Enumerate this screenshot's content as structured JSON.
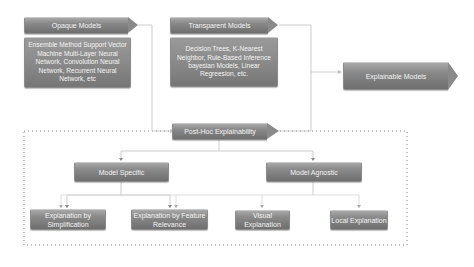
{
  "diagram": {
    "colors": {
      "box_fill_top": "#a8a8a8",
      "box_fill_bottom": "#6e6e6e",
      "text": "#f4f4f4",
      "connector": "#c0c0c0",
      "dotted_border": "#6a6a6a"
    },
    "nodes": {
      "opaque": {
        "title": "Opaque Models",
        "body": "Ensemble Method Support Vector Machine Multi-Layer Neural Network, Convolution Neural Network, Recurrent Neural Network, etc"
      },
      "transparent": {
        "title": "Transparent Models",
        "body": "Decision Trees, K-Nearest Neighbor, Rule-Based Inference bayesian Models, Linear Regreesion, etc."
      },
      "explainable": {
        "title": "Explainable Models"
      },
      "posthoc": {
        "title": "Post-Hoc Explainability"
      },
      "model_specific": {
        "title": "Model Specific"
      },
      "model_agnostic": {
        "title": "Model Agnostic"
      },
      "leaves": [
        {
          "title": "Explanation by Simplification"
        },
        {
          "title": "Explanation by Feature Relevance"
        },
        {
          "title": "Visual Explanation"
        },
        {
          "title": "Local Explanation"
        }
      ]
    },
    "edges": [
      {
        "from": "Opaque Models",
        "to": "Post-Hoc Explainability"
      },
      {
        "from": "Transparent Models",
        "to": "Explainable Models"
      },
      {
        "from": "Post-Hoc Explainability",
        "to": "Explainable Models"
      },
      {
        "from": "Post-Hoc Explainability",
        "to": "Model Specific"
      },
      {
        "from": "Post-Hoc Explainability",
        "to": "Model Agnostic"
      },
      {
        "from": "Model Specific",
        "to": "Explanation by Simplification"
      },
      {
        "from": "Model Specific",
        "to": "Explanation by Feature Relevance"
      },
      {
        "from": "Model Agnostic",
        "to": "Explanation by Simplification"
      },
      {
        "from": "Model Agnostic",
        "to": "Explanation by Feature Relevance"
      },
      {
        "from": "Model Agnostic",
        "to": "Visual Explanation"
      },
      {
        "from": "Model Agnostic",
        "to": "Local Explanation"
      }
    ]
  }
}
